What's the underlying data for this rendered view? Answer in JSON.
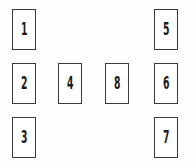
{
  "figure": {
    "type": "card-layout-diagram",
    "background_color": "#fdfdfd",
    "card_fill_color": "#ffffff",
    "card_border_color": "#3a3a3a",
    "label_color": "#1a1a1a",
    "canvas_width": 194,
    "canvas_height": 167
  },
  "groups": {
    "left_column": "left-column",
    "middle_row": "middle-row",
    "right_column": "right-column"
  },
  "cards": [
    {
      "id": "card-1",
      "label": "1",
      "column": "left",
      "row": "top",
      "x": 12,
      "y": 9,
      "width": 24,
      "height": 41
    },
    {
      "id": "card-2",
      "label": "2",
      "column": "left",
      "row": "middle",
      "x": 12,
      "y": 63,
      "width": 24,
      "height": 41
    },
    {
      "id": "card-3",
      "label": "3",
      "column": "left",
      "row": "bottom",
      "x": 12,
      "y": 117,
      "width": 24,
      "height": 41
    },
    {
      "id": "card-4",
      "label": "4",
      "column": "middle-left",
      "row": "middle",
      "x": 58,
      "y": 63,
      "width": 24,
      "height": 41
    },
    {
      "id": "card-8",
      "label": "8",
      "column": "middle-right",
      "row": "middle",
      "x": 105,
      "y": 63,
      "width": 24,
      "height": 41
    },
    {
      "id": "card-5",
      "label": "5",
      "column": "right",
      "row": "top",
      "x": 154,
      "y": 9,
      "width": 24,
      "height": 41
    },
    {
      "id": "card-6",
      "label": "6",
      "column": "right",
      "row": "middle",
      "x": 154,
      "y": 63,
      "width": 24,
      "height": 41
    },
    {
      "id": "card-7",
      "label": "7",
      "column": "right",
      "row": "bottom",
      "x": 154,
      "y": 117,
      "width": 24,
      "height": 41
    }
  ]
}
